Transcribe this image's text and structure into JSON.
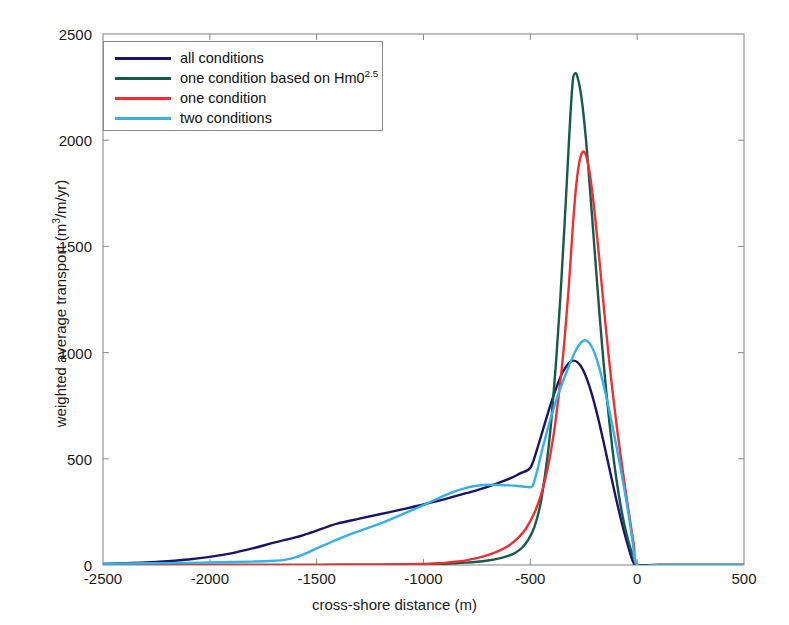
{
  "chart_data": {
    "type": "line",
    "title": "",
    "xlabel": "cross-shore distance (m)",
    "ylabel_parts": {
      "pre": "weighted average transport (m",
      "sup": "3",
      "post": "/m/yr)"
    },
    "ylabel": "weighted average transport (m3/m/yr)",
    "xlim": [
      -2500,
      500
    ],
    "ylim": [
      0,
      2500
    ],
    "xticks": [
      -2500,
      -2000,
      -1500,
      -1000,
      -500,
      0,
      500
    ],
    "yticks": [
      0,
      500,
      1000,
      1500,
      2000,
      2500
    ],
    "grid": false,
    "legend_position": "upper-left",
    "series": [
      {
        "name": "all conditions",
        "label_parts": {
          "pre": "all conditions",
          "sup": "",
          "post": ""
        },
        "color": "#1b1464",
        "x": [
          -2500,
          -2400,
          -2300,
          -2200,
          -2100,
          -2000,
          -1900,
          -1800,
          -1700,
          -1600,
          -1550,
          -1500,
          -1450,
          -1400,
          -1300,
          -1200,
          -1100,
          -1000,
          -900,
          -800,
          -700,
          -600,
          -550,
          -500,
          -470,
          -440,
          -410,
          -380,
          -350,
          -320,
          -300,
          -280,
          -260,
          -240,
          -220,
          -200,
          -180,
          -160,
          -140,
          -120,
          -100,
          -80,
          -60,
          -40,
          -20,
          0,
          100,
          300,
          500
        ],
        "y": [
          5,
          8,
          12,
          18,
          26,
          38,
          55,
          78,
          105,
          130,
          145,
          162,
          180,
          196,
          218,
          240,
          262,
          285,
          310,
          338,
          368,
          405,
          430,
          458,
          540,
          640,
          740,
          830,
          905,
          950,
          962,
          955,
          930,
          888,
          830,
          760,
          680,
          592,
          500,
          408,
          318,
          232,
          152,
          80,
          18,
          0,
          0,
          0,
          0
        ]
      },
      {
        "name": "one condition based on Hm0^2.5",
        "label_parts": {
          "pre": "one condition based on Hm0",
          "sup": "2.5",
          "post": ""
        },
        "color": "#155b4a",
        "x": [
          -2500,
          -2200,
          -2000,
          -1800,
          -1600,
          -1400,
          -1200,
          -1000,
          -900,
          -850,
          -800,
          -750,
          -700,
          -650,
          -600,
          -570,
          -540,
          -510,
          -480,
          -450,
          -420,
          -400,
          -380,
          -360,
          -340,
          -320,
          -310,
          -300,
          -290,
          -280,
          -265,
          -250,
          -235,
          -220,
          -205,
          -190,
          -175,
          -160,
          -145,
          -130,
          -115,
          -100,
          -85,
          -70,
          -55,
          -40,
          -25,
          -10,
          0,
          100,
          300,
          500
        ],
        "y": [
          0,
          0,
          0,
          0,
          0,
          1,
          2,
          4,
          6,
          8,
          11,
          15,
          21,
          30,
          44,
          58,
          80,
          118,
          182,
          300,
          510,
          700,
          950,
          1250,
          1600,
          1980,
          2160,
          2290,
          2315,
          2300,
          2230,
          2110,
          1950,
          1760,
          1560,
          1360,
          1165,
          985,
          820,
          672,
          540,
          425,
          325,
          240,
          168,
          108,
          58,
          16,
          0,
          0,
          0,
          0
        ]
      },
      {
        "name": "one condition",
        "label_parts": {
          "pre": "one condition",
          "sup": "",
          "post": ""
        },
        "color": "#ee2f33",
        "x": [
          -2500,
          -2200,
          -2000,
          -1800,
          -1600,
          -1400,
          -1200,
          -1000,
          -950,
          -900,
          -850,
          -800,
          -750,
          -700,
          -650,
          -600,
          -560,
          -520,
          -480,
          -450,
          -420,
          -390,
          -360,
          -340,
          -320,
          -300,
          -285,
          -270,
          -255,
          -240,
          -225,
          -210,
          -195,
          -180,
          -165,
          -150,
          -135,
          -120,
          -105,
          -90,
          -75,
          -60,
          -45,
          -30,
          -15,
          0,
          100,
          300,
          500
        ],
        "y": [
          0,
          0,
          0,
          0,
          0,
          1,
          2,
          5,
          7,
          10,
          15,
          22,
          32,
          46,
          65,
          92,
          125,
          172,
          248,
          330,
          450,
          620,
          860,
          1060,
          1310,
          1610,
          1790,
          1900,
          1945,
          1930,
          1862,
          1755,
          1620,
          1470,
          1310,
          1150,
          1000,
          860,
          730,
          610,
          498,
          390,
          288,
          188,
          92,
          0,
          0,
          0,
          0
        ]
      },
      {
        "name": "two conditions",
        "label_parts": {
          "pre": "two conditions",
          "sup": "",
          "post": ""
        },
        "color": "#35b1e5",
        "x": [
          -2500,
          -2300,
          -2100,
          -2000,
          -1900,
          -1800,
          -1700,
          -1650,
          -1600,
          -1550,
          -1500,
          -1450,
          -1400,
          -1350,
          -1300,
          -1200,
          -1100,
          -1000,
          -950,
          -900,
          -850,
          -800,
          -760,
          -720,
          -680,
          -640,
          -600,
          -560,
          -520,
          -500,
          -490,
          -480,
          -465,
          -450,
          -430,
          -410,
          -390,
          -370,
          -350,
          -330,
          -310,
          -290,
          -275,
          -260,
          -245,
          -230,
          -215,
          -200,
          -185,
          -170,
          -155,
          -140,
          -125,
          -110,
          -95,
          -80,
          -65,
          -50,
          -35,
          -20,
          0,
          100,
          300,
          500
        ],
        "y": [
          6,
          8,
          10,
          12,
          14,
          16,
          20,
          24,
          36,
          55,
          78,
          100,
          122,
          142,
          160,
          196,
          238,
          282,
          305,
          328,
          348,
          363,
          372,
          377,
          378,
          377,
          375,
          372,
          368,
          366,
          372,
          400,
          455,
          520,
          598,
          672,
          740,
          802,
          858,
          910,
          960,
          1005,
          1032,
          1050,
          1058,
          1052,
          1032,
          1000,
          955,
          900,
          838,
          772,
          700,
          625,
          548,
          468,
          385,
          298,
          205,
          100,
          0,
          0,
          0,
          0
        ]
      }
    ]
  },
  "legend": {
    "items": [
      {
        "label": "all conditions",
        "color": "#1b1464"
      },
      {
        "label": "one condition based on Hm02.5",
        "color": "#155b4a"
      },
      {
        "label": "one condition",
        "color": "#ee2f33"
      },
      {
        "label": "two conditions",
        "color": "#35b1e5"
      }
    ]
  },
  "axes": {
    "frame_color": "#8a8a8a",
    "tick_color": "#8a8a8a",
    "text_color": "#1a1a1a"
  }
}
